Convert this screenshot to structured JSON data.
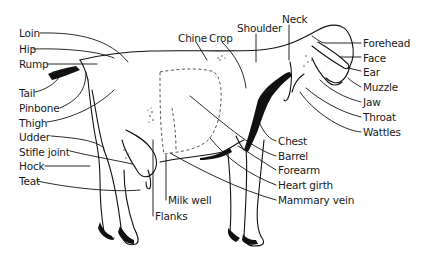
{
  "diagram": {
    "labels_left": [
      {
        "id": "loin",
        "text": "Loin",
        "x": 19,
        "y": 27
      },
      {
        "id": "hip",
        "text": "Hip",
        "x": 19,
        "y": 43
      },
      {
        "id": "rump",
        "text": "Rump",
        "x": 19,
        "y": 58
      },
      {
        "id": "tail",
        "text": "Tail",
        "x": 19,
        "y": 87
      },
      {
        "id": "pinbone",
        "text": "Pinbone",
        "x": 19,
        "y": 102
      },
      {
        "id": "thigh",
        "text": "Thigh",
        "x": 19,
        "y": 117
      },
      {
        "id": "udder",
        "text": "Udder",
        "x": 19,
        "y": 131
      },
      {
        "id": "stifle-joint",
        "text": "Stifle joint",
        "x": 19,
        "y": 146
      },
      {
        "id": "hock",
        "text": "Hock",
        "x": 19,
        "y": 160
      },
      {
        "id": "teat",
        "text": "Teat",
        "x": 19,
        "y": 175
      }
    ],
    "labels_top": [
      {
        "id": "chine",
        "text": "Chine",
        "x": 178,
        "y": 32
      },
      {
        "id": "crop",
        "text": "Crop",
        "x": 209,
        "y": 32
      },
      {
        "id": "shoulder",
        "text": "Shoulder",
        "x": 237,
        "y": 22
      },
      {
        "id": "neck",
        "text": "Neck",
        "x": 282,
        "y": 13
      }
    ],
    "labels_right": [
      {
        "id": "forehead",
        "text": "Forehead",
        "x": 363,
        "y": 37
      },
      {
        "id": "face",
        "text": "Face",
        "x": 363,
        "y": 52
      },
      {
        "id": "ear",
        "text": "Ear",
        "x": 363,
        "y": 66
      },
      {
        "id": "muzzle",
        "text": "Muzzle",
        "x": 363,
        "y": 81
      },
      {
        "id": "jaw",
        "text": "Jaw",
        "x": 363,
        "y": 96
      },
      {
        "id": "throat",
        "text": "Throat",
        "x": 363,
        "y": 111
      },
      {
        "id": "wattles",
        "text": "Wattles",
        "x": 363,
        "y": 126
      }
    ],
    "labels_bottom_right": [
      {
        "id": "chest",
        "text": "Chest",
        "x": 278,
        "y": 135
      },
      {
        "id": "barrel",
        "text": "Barrel",
        "x": 278,
        "y": 150
      },
      {
        "id": "forearm",
        "text": "Forearm",
        "x": 278,
        "y": 164
      },
      {
        "id": "heart-girth",
        "text": "Heart girth",
        "x": 278,
        "y": 179
      },
      {
        "id": "mammary-vein",
        "text": "Mammary vein",
        "x": 278,
        "y": 194
      }
    ],
    "labels_bottom": [
      {
        "id": "milk-well",
        "text": "Milk well",
        "x": 168,
        "y": 194
      },
      {
        "id": "flanks",
        "text": "Flanks",
        "x": 155,
        "y": 210
      }
    ]
  }
}
